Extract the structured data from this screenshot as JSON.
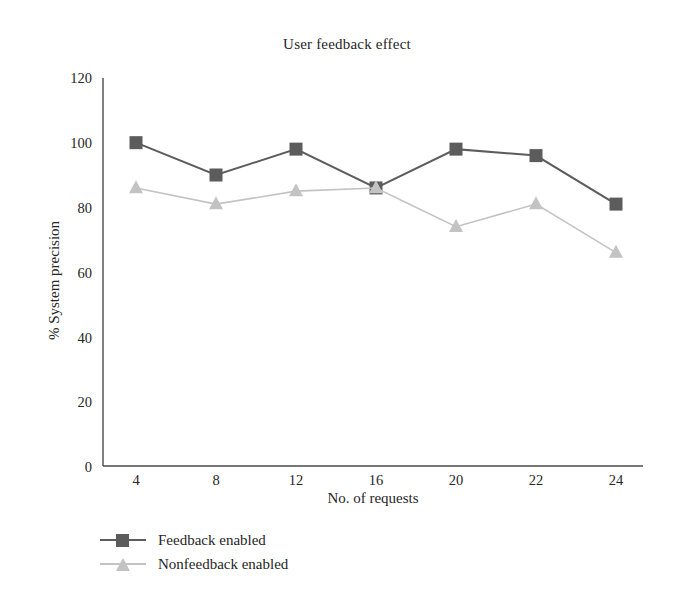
{
  "chart_data": {
    "type": "line",
    "title": "User feedback effect",
    "xlabel": "No. of requests",
    "ylabel": "% System precision",
    "categories": [
      "4",
      "8",
      "12",
      "16",
      "20",
      "22",
      "24"
    ],
    "series": [
      {
        "name": "Feedback enabled",
        "marker": "square",
        "color": "#5c5c5c",
        "values": [
          100,
          90,
          98,
          86,
          98,
          96,
          81
        ]
      },
      {
        "name": "Nonfeedback enabled",
        "marker": "triangle",
        "color": "#c3c3c3",
        "values": [
          86,
          81,
          85,
          86,
          74,
          81,
          66
        ]
      }
    ],
    "ylim": [
      0,
      120
    ],
    "yticks": [
      "0",
      "20",
      "40",
      "60",
      "80",
      "100",
      "120"
    ],
    "grid": false,
    "legend_position": "bottom-left",
    "axis_color": "#4a4a4a"
  }
}
